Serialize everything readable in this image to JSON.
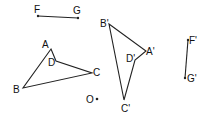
{
  "diagram": {
    "title": "",
    "segments": [
      {
        "name": "FG",
        "from": "F",
        "to": "G"
      },
      {
        "name": "F'G'",
        "from": "F'",
        "to": "G'"
      }
    ],
    "polygons": [
      {
        "name": "ABCD",
        "vertices": [
          "A",
          "B",
          "C",
          "D"
        ]
      },
      {
        "name": "A'B'C'D'",
        "vertices": [
          "A'",
          "B'",
          "C'",
          "D'"
        ]
      }
    ],
    "points": {
      "F": {
        "label": "F",
        "x": 38,
        "y": 16
      },
      "G": {
        "label": "G",
        "x": 78,
        "y": 18
      },
      "A": {
        "label": "A",
        "x": 51,
        "y": 49
      },
      "D": {
        "label": "D",
        "x": 56,
        "y": 61
      },
      "C": {
        "label": "C",
        "x": 92,
        "y": 73
      },
      "B": {
        "label": "B",
        "x": 23,
        "y": 88
      },
      "O": {
        "label": "O",
        "x": 97,
        "y": 99
      },
      "B_prime": {
        "label": "B'",
        "x": 109,
        "y": 24
      },
      "A_prime": {
        "label": "A'",
        "x": 146,
        "y": 51
      },
      "D_prime": {
        "label": "D'",
        "x": 135,
        "y": 60
      },
      "C_prime": {
        "label": "C'",
        "x": 124,
        "y": 100
      },
      "F_prime": {
        "label": "F'",
        "x": 188,
        "y": 40
      },
      "G_prime": {
        "label": "G'",
        "x": 185,
        "y": 78
      }
    }
  }
}
